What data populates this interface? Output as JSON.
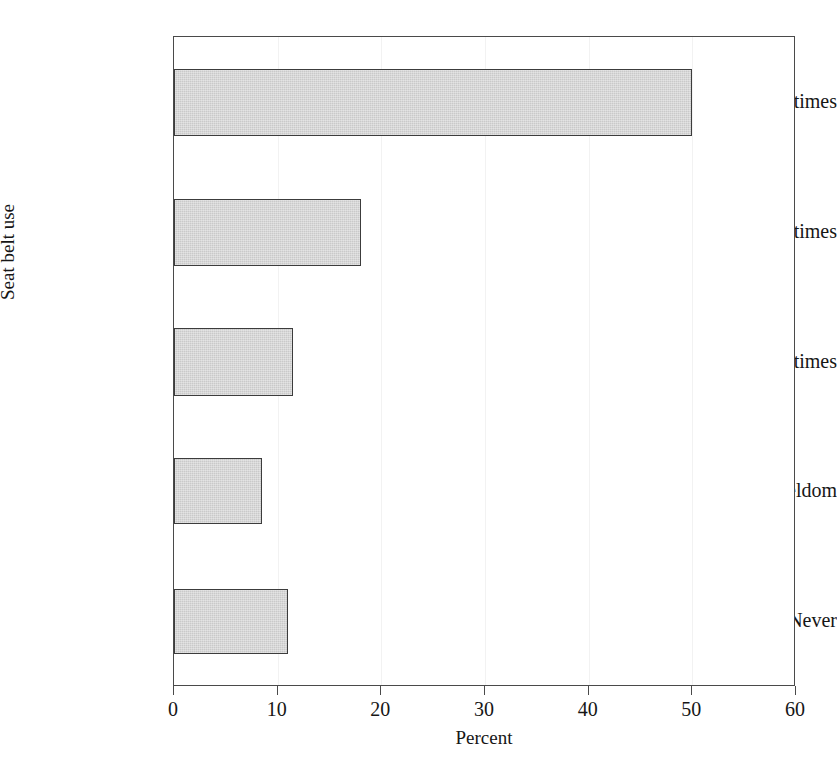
{
  "chart_data": {
    "type": "bar",
    "orientation": "horizontal",
    "title": "",
    "xlabel": "Percent",
    "ylabel": "Seat belt use",
    "categories": [
      "All times",
      "Most times",
      "Sometimes",
      "Seldom",
      "Never"
    ],
    "values": [
      50,
      18,
      11.5,
      8.5,
      11
    ],
    "xlim": [
      0,
      60
    ],
    "xticks": [
      0,
      10,
      20,
      30,
      40,
      50,
      60
    ],
    "xticklabels": [
      "0",
      "10",
      "20",
      "30",
      "40",
      "50",
      "60"
    ],
    "grid": "faint vertical gridlines at x ticks",
    "legend": "none",
    "bar_fill_color": "#c9c9c9",
    "bar_edge_color": "#3c3c3c",
    "frame_color": "#4a4a4a",
    "background_color": "#ffffff"
  },
  "axes": {
    "x_title": "Percent",
    "y_title": "Seat belt use"
  },
  "geometry": {
    "plot_left": 173,
    "plot_right": 795,
    "plot_top": 36,
    "plot_bottom": 686,
    "bars": [
      {
        "top": 68,
        "height": 67,
        "label_center": 101
      },
      {
        "top": 198,
        "height": 67,
        "label_center": 231
      },
      {
        "top": 327,
        "height": 68,
        "label_center": 361
      },
      {
        "top": 457,
        "height": 66,
        "label_center": 490
      },
      {
        "top": 588,
        "height": 65,
        "label_center": 620
      }
    ]
  }
}
